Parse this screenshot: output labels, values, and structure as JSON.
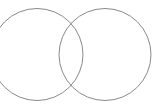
{
  "diagram": {
    "type": "venn",
    "stroke_color": "#8a8a8a",
    "background": "#ffffff",
    "circles": [
      {
        "name": "left-circle",
        "cx": 37,
        "cy": 54.5,
        "r": 46
      },
      {
        "name": "right-circle",
        "cx": 105,
        "cy": 54.5,
        "r": 46
      }
    ]
  }
}
